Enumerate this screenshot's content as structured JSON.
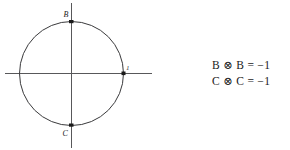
{
  "figure": {
    "shape": "unit-circle",
    "center": {
      "x": 71,
      "y": 73
    },
    "radius": 52,
    "axes": {
      "horizontal": {
        "x1": 5,
        "x2": 152,
        "y": 73
      },
      "vertical": {
        "y1": 3,
        "y2": 148,
        "x": 71
      }
    },
    "points": [
      {
        "id": "top",
        "label": "B",
        "x": 71,
        "y": 21,
        "label_x": 64,
        "label_y": 17
      },
      {
        "id": "right",
        "label": "1",
        "x": 123,
        "y": 73,
        "label_x": 126,
        "label_y": 70
      },
      {
        "id": "bottom",
        "label": "C",
        "x": 71,
        "y": 125,
        "label_x": 63,
        "label_y": 136
      }
    ],
    "colors": {
      "circle_stroke": "#3a3a3c",
      "axis_stroke": "#58585a",
      "point_fill": "#1a1a1a",
      "text": "#1a1a1a",
      "background": "#ffffff"
    }
  },
  "equations": {
    "lines": [
      "B ⊗ B = −1",
      "C ⊗ C = −1"
    ]
  }
}
